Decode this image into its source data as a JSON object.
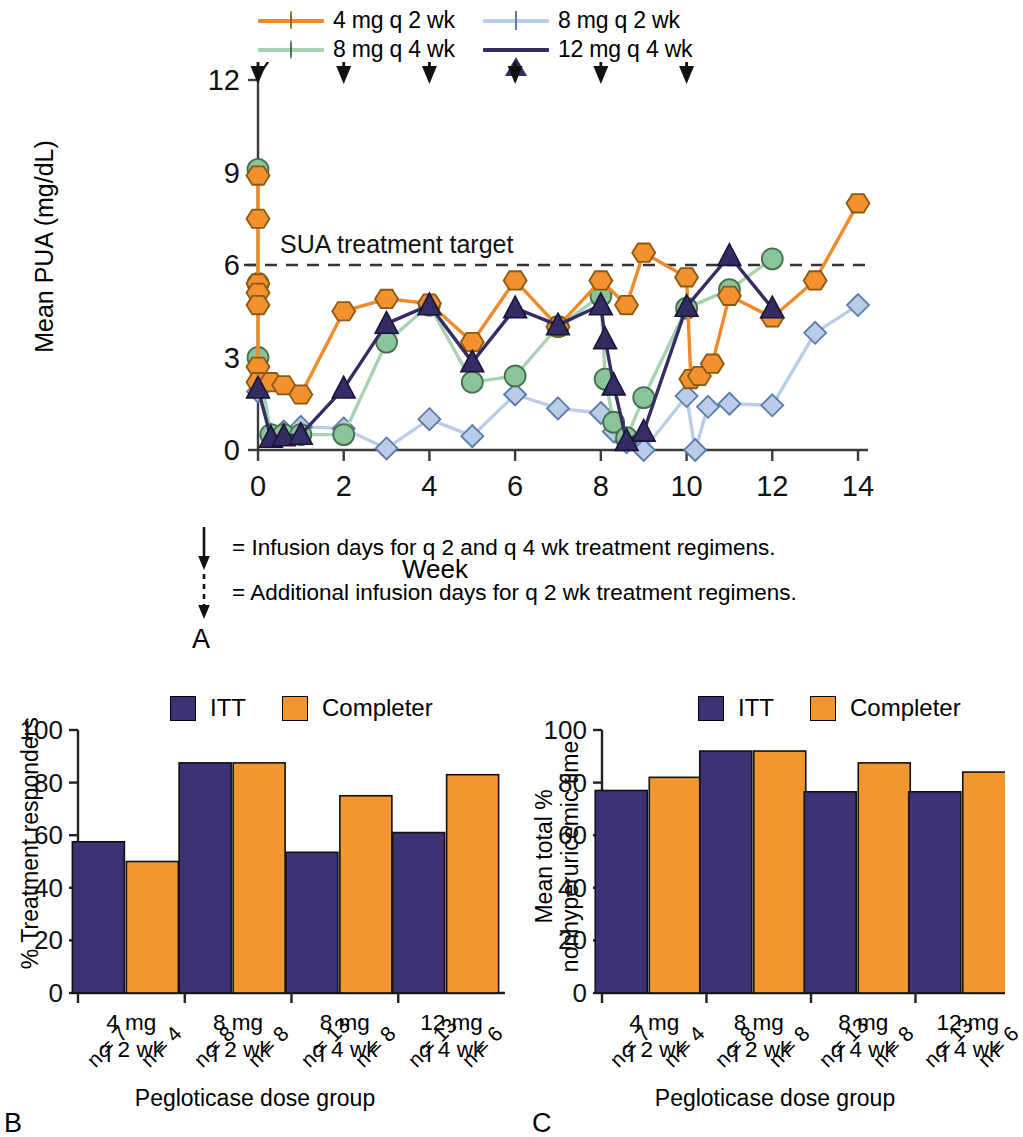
{
  "figure": {
    "panel_letters": {
      "a": "A",
      "b": "B",
      "c": "C"
    }
  },
  "panelA": {
    "legend": [
      {
        "label": "4 mg q 2 wk",
        "marker": "hexagon-marker",
        "color": "#f2912d",
        "line": "#f08a2a"
      },
      {
        "label": "8 mg q 2 wk",
        "marker": "diamond-marker",
        "color": "#b9cde9",
        "line": "#b9cde9"
      },
      {
        "label": "8 mg q 4 wk",
        "marker": "circle-marker",
        "color": "#8cc49a",
        "line": "#a8d3b2"
      },
      {
        "label": "12 mg q 4 wk",
        "marker": "triangle-marker",
        "color": "#332d63",
        "line": "#332d63"
      }
    ],
    "annotation": "SUA treatment target",
    "footnotes": [
      {
        "arrow": "solid-arrow",
        "text": "= Infusion days for q 2 and q 4 wk treatment regimens."
      },
      {
        "arrow": "dashed-arrow",
        "text": "= Additional infusion days for q 2 wk treatment regimens."
      }
    ],
    "chart_data": {
      "type": "line",
      "title": "",
      "xlabel": "Week",
      "ylabel": "Mean PUA (mg/dL)",
      "xlim": [
        0,
        14
      ],
      "ylim": [
        0,
        12
      ],
      "xticks": [
        0,
        2,
        4,
        6,
        8,
        10,
        12,
        14
      ],
      "yticks": [
        0,
        3,
        6,
        9,
        12
      ],
      "grid": false,
      "legend_position": "top",
      "threshold_line": {
        "y": 6,
        "label": "SUA treatment target",
        "style": "dashed"
      },
      "infusion_arrows_solid": [
        0,
        4,
        8
      ],
      "infusion_arrows_dashed": [
        2,
        6,
        10
      ],
      "series": [
        {
          "name": "4 mg q 2 wk",
          "color": "#f08a2a",
          "marker": "hexagon",
          "x": [
            0,
            0,
            0,
            0,
            0,
            0,
            0,
            0.3,
            0.6,
            1,
            2,
            3,
            4,
            5,
            6,
            7,
            8,
            8.6,
            9,
            10,
            10.1,
            10.3,
            10.6,
            11,
            12,
            13,
            14
          ],
          "y": [
            8.9,
            7.5,
            5.4,
            5.1,
            4.7,
            2.7,
            2.2,
            2.2,
            2.1,
            1.8,
            4.5,
            4.9,
            4.75,
            3.5,
            5.5,
            4.0,
            5.5,
            4.7,
            6.4,
            5.6,
            2.3,
            2.4,
            2.8,
            5.0,
            4.3,
            5.5,
            8.0
          ]
        },
        {
          "name": "8 mg q 4 wk",
          "color": "#a8d3b2",
          "marker": "circle",
          "x": [
            0,
            0,
            0,
            0.3,
            0.6,
            1,
            2,
            3,
            4,
            5,
            6,
            7,
            8,
            8.1,
            8.3,
            8.6,
            9,
            10,
            11,
            12
          ],
          "y": [
            9.1,
            5.4,
            3.0,
            0.5,
            0.5,
            0.5,
            0.5,
            3.5,
            4.7,
            2.2,
            2.4,
            4.0,
            5.0,
            2.3,
            0.9,
            0.4,
            1.7,
            4.6,
            5.2,
            6.2
          ]
        },
        {
          "name": "12 mg q 4 wk",
          "color": "#332d63",
          "marker": "triangle",
          "x": [
            0,
            0.3,
            0.6,
            1,
            2,
            3,
            4,
            5,
            6,
            7,
            8,
            8.1,
            8.3,
            8.6,
            9,
            10,
            11,
            12
          ],
          "y": [
            2.0,
            0.4,
            0.45,
            0.5,
            2.0,
            4.1,
            4.7,
            2.85,
            4.6,
            4.05,
            4.7,
            3.6,
            2.1,
            0.3,
            0.6,
            4.65,
            6.3,
            4.6
          ]
        },
        {
          "name": "8 mg q 2 wk",
          "color": "#b9cde9",
          "marker": "diamond",
          "x": [
            0,
            0.3,
            0.6,
            1,
            2,
            3,
            4,
            5,
            6,
            7,
            8,
            8.3,
            8.6,
            9,
            10,
            10.2,
            10.5,
            11,
            12,
            13,
            14
          ],
          "y": [
            1.9,
            0.5,
            0.6,
            0.75,
            0.7,
            0.05,
            1.0,
            0.45,
            1.8,
            1.35,
            1.2,
            0.6,
            0.25,
            0.0,
            1.75,
            0.0,
            1.4,
            1.5,
            1.45,
            3.8,
            4.7
          ]
        }
      ]
    }
  },
  "panelB": {
    "legend": [
      {
        "label": "ITT",
        "color": "#3d3273"
      },
      {
        "label": "Completer",
        "color": "#f2972f"
      }
    ],
    "chart_data": {
      "type": "bar",
      "title": "",
      "ylabel": "% Treatment responders",
      "xlabel": "Pegloticase dose group",
      "ylim": [
        0,
        100
      ],
      "yticks": [
        0,
        20,
        40,
        60,
        80,
        100
      ],
      "grid": false,
      "legend_position": "top",
      "categories": [
        "4 mg\nq 2 wk",
        "8 mg\nq 2 wk",
        "8 mg\nq 4 wk",
        "12 mg\nq 4 wk"
      ],
      "group_labels": [
        {
          "line1": "4 mg",
          "line2": "q 2 wk"
        },
        {
          "line1": "8 mg",
          "line2": "q 2 wk"
        },
        {
          "line1": "8 mg",
          "line2": "q 4 wk"
        },
        {
          "line1": "12 mg",
          "line2": "q 4 wk"
        }
      ],
      "bar_tick_labels": [
        "n = 7",
        "n = 4",
        "n = 8",
        "n = 8",
        "n = 13",
        "n = 8",
        "n = 13",
        "n = 6"
      ],
      "series": [
        {
          "name": "ITT",
          "color": "#3d3273",
          "values": [
            57.5,
            87.5,
            53.5,
            61.0
          ]
        },
        {
          "name": "Completer",
          "color": "#f2972f",
          "values": [
            50.0,
            87.5,
            75.0,
            83.0
          ]
        }
      ]
    }
  },
  "panelC": {
    "legend": [
      {
        "label": "ITT",
        "color": "#3d3273"
      },
      {
        "label": "Completer",
        "color": "#f2972f"
      }
    ],
    "chart_data": {
      "type": "bar",
      "title": "",
      "ylabel_line1": "Mean total %",
      "ylabel_line2": "nonhyperuricemic time",
      "xlabel": "Pegloticase dose group",
      "ylim": [
        0,
        100
      ],
      "yticks": [
        0,
        20,
        40,
        60,
        80,
        100
      ],
      "grid": false,
      "legend_position": "top",
      "categories": [
        "4 mg\nq 2 wk",
        "8 mg\nq 2 wk",
        "8 mg\nq 4 wk",
        "12 mg\nq 4 wk"
      ],
      "group_labels": [
        {
          "line1": "4 mg",
          "line2": "q 2 wk"
        },
        {
          "line1": "8 mg",
          "line2": "q 2 wk"
        },
        {
          "line1": "8 mg",
          "line2": "q 4 wk"
        },
        {
          "line1": "12 mg",
          "line2": "q 4 wk"
        }
      ],
      "bar_tick_labels": [
        "n = 7",
        "n = 4",
        "n = 8",
        "n = 8",
        "n = 13",
        "n = 8",
        "n = 13",
        "n = 6"
      ],
      "series": [
        {
          "name": "ITT",
          "color": "#3d3273",
          "values": [
            77.0,
            92.0,
            76.5,
            76.5
          ]
        },
        {
          "name": "Completer",
          "color": "#f2972f",
          "values": [
            82.0,
            92.0,
            87.5,
            84.0
          ]
        }
      ]
    }
  }
}
